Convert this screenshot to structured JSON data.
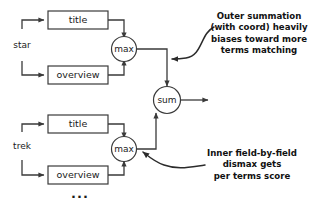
{
  "diagram": {
    "colors": {
      "stroke": "#3a3a3a",
      "text": "#1a1a1a",
      "annotation": "#111111",
      "background": "#ffffff"
    },
    "terms": [
      {
        "id": "star",
        "label": "star"
      },
      {
        "id": "trek",
        "label": "trek"
      }
    ],
    "groups": [
      {
        "term": "star",
        "fields": [
          {
            "id": "star-title",
            "label": "title"
          },
          {
            "id": "star-overview",
            "label": "overview"
          }
        ],
        "combiner": {
          "id": "star-max",
          "label": "max"
        }
      },
      {
        "term": "trek",
        "fields": [
          {
            "id": "trek-title",
            "label": "title"
          },
          {
            "id": "trek-overview",
            "label": "overview"
          }
        ],
        "combiner": {
          "id": "trek-max",
          "label": "max"
        }
      }
    ],
    "aggregator": {
      "id": "sum",
      "label": "sum"
    },
    "continuation": {
      "label": "..."
    },
    "annotations": [
      {
        "id": "outer-summation",
        "lines": [
          "Outer summation",
          "(with coord) heavily",
          "biases toward more",
          "terms matching"
        ],
        "line1": "Outer summation",
        "line2": "(with coord) heavily",
        "line3": "biases toward more",
        "line4": "terms matching"
      },
      {
        "id": "inner-dismax",
        "lines": [
          "Inner field-by-field",
          "dismax gets",
          "per terms score"
        ],
        "line1": "Inner field-by-field",
        "line2": "dismax gets",
        "line3": "per terms score"
      }
    ]
  }
}
